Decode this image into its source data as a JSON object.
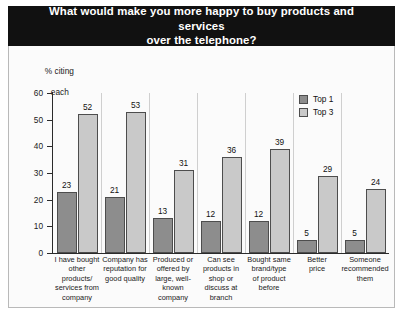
{
  "chart_data": {
    "type": "bar",
    "title": "What would make you more happy to buy products and services over the telephone?",
    "title_line1": "What would make you more happy to buy products and services",
    "title_line2": "over the telephone?",
    "ylabel": "% citing\neach",
    "ylabel_line1": "% citing",
    "ylabel_line2": "each",
    "xlabel": "",
    "ylim": [
      0,
      60
    ],
    "yticks": [
      0,
      10,
      20,
      30,
      40,
      50,
      60
    ],
    "ytick_labels": [
      "0",
      "10",
      "20",
      "30",
      "40",
      "50",
      "60"
    ],
    "grid": false,
    "legend_position": "top-right",
    "categories": [
      "I have bought\nother products/\nservices from\ncompany",
      "Company has\nreputation for\ngood quality",
      "Produced or\noffered by\nlarge, well-\nknown\ncompany",
      "Can see\nproducts in\nshop or\ndiscuss at\nbranch",
      "Bought same\nbrand/type\nof product\nbefore",
      "Better\nprice",
      "Someone\nrecommended\nthem"
    ],
    "series": [
      {
        "name": "Top 1",
        "color": "#8d8d8d",
        "values": [
          23,
          21,
          13,
          12,
          12,
          5,
          5
        ]
      },
      {
        "name": "Top 3",
        "color": "#c9c9c9",
        "values": [
          52,
          53,
          31,
          36,
          39,
          29,
          24
        ]
      }
    ]
  },
  "legend": {
    "items": [
      {
        "label": "Top 1",
        "swatch": "top1"
      },
      {
        "label": "Top 3",
        "swatch": "top3"
      }
    ]
  },
  "colors": {
    "banner_bg": "#111111",
    "banner_text": "#ffffff",
    "top1": "#8d8d8d",
    "top3": "#c9c9c9",
    "axis": "#2b2b2b",
    "panel_bg": "#fbfbfb",
    "panel_border": "#b9b9b9"
  },
  "source": ""
}
